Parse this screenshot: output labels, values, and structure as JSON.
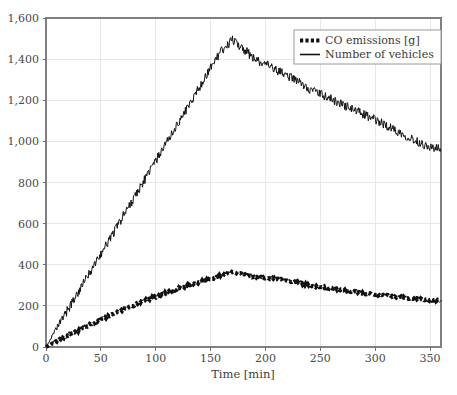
{
  "chart_data": {
    "type": "line",
    "title": "",
    "xlabel": "Time [min]",
    "ylabel": "",
    "xlim": [
      0,
      360
    ],
    "ylim": [
      0,
      1600
    ],
    "grid": true,
    "legend_position": "top-right",
    "xticks": [
      0,
      50,
      100,
      150,
      200,
      250,
      300,
      350
    ],
    "xtick_labels": [
      "0",
      "50",
      "100",
      "150",
      "200",
      "250",
      "300",
      "350"
    ],
    "yticks": [
      0,
      200,
      400,
      600,
      800,
      1000,
      1200,
      1400,
      1600
    ],
    "ytick_labels": [
      "0",
      "200",
      "400",
      "600",
      "800",
      "1,000",
      "1,200",
      "1,400",
      "1,600"
    ],
    "x": [
      0,
      10,
      20,
      30,
      40,
      50,
      60,
      70,
      80,
      90,
      100,
      110,
      120,
      130,
      140,
      150,
      160,
      170,
      180,
      190,
      200,
      210,
      220,
      230,
      240,
      250,
      260,
      270,
      280,
      290,
      300,
      310,
      320,
      330,
      340,
      350,
      360
    ],
    "series": [
      {
        "name": "CO emissions [g]",
        "style": "dotted-square-markers",
        "color": "#111111",
        "values": [
          0,
          28,
          55,
          82,
          108,
          132,
          156,
          180,
          203,
          226,
          245,
          265,
          283,
          300,
          315,
          330,
          348,
          362,
          352,
          340,
          335,
          330,
          322,
          312,
          300,
          292,
          285,
          278,
          270,
          262,
          256,
          250,
          244,
          238,
          233,
          228,
          225
        ]
      },
      {
        "name": "Number of vehicles",
        "style": "solid",
        "color": "#111111",
        "values": [
          0,
          92,
          182,
          272,
          363,
          452,
          543,
          634,
          723,
          815,
          905,
          995,
          1085,
          1175,
          1265,
          1360,
          1440,
          1495,
          1450,
          1400,
          1375,
          1345,
          1320,
          1290,
          1255,
          1230,
          1205,
          1180,
          1155,
          1130,
          1105,
          1078,
          1050,
          1022,
          995,
          972,
          960
        ]
      }
    ],
    "noise": {
      "vehicles_amplitude": 22,
      "co_amplitude": 5
    }
  },
  "legend": {
    "entries": [
      {
        "label": "CO emissions [g]",
        "marker": "dotted-square-marker"
      },
      {
        "label": "Number of vehicles",
        "marker": "solid-line-marker"
      }
    ]
  },
  "axes": {
    "x_axis_title": "Time [min]"
  }
}
